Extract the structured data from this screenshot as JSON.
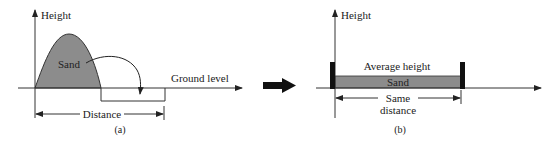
{
  "panel_a": {
    "axis_label": "Height",
    "sand_label": "Sand",
    "ground_label": "Ground level",
    "distance_label": "Distance",
    "caption": "(a)"
  },
  "panel_b": {
    "axis_label": "Height",
    "average_label": "Average height",
    "sand_label": "Sand",
    "distance_label_line1": "Same",
    "distance_label_line2": "distance",
    "caption": "(b)"
  },
  "colors": {
    "sand_fill": "#8c8c8c",
    "line": "#333333",
    "wall": "#111111"
  }
}
